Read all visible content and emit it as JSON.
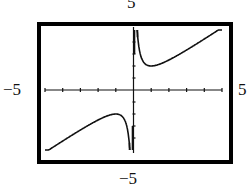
{
  "chart_data": {
    "type": "line",
    "title": "",
    "function": "y = x + 1/x",
    "xlabel": "",
    "ylabel": "",
    "xlim": [
      -5,
      5
    ],
    "ylim": [
      -5,
      5
    ],
    "window_labels": {
      "top": "5",
      "bottom": "−5",
      "left": "−5",
      "right": "5"
    },
    "x_ticks_step": 1,
    "y_ticks_step": 1,
    "grid": false,
    "legend": null,
    "series": [
      {
        "name": "left branch",
        "x": [
          -5,
          -4,
          -3,
          -2,
          -1.5,
          -1,
          -0.7,
          -0.5,
          -0.35,
          -0.25,
          -0.2
        ],
        "y": [
          -5.2,
          -4.25,
          -3.33,
          -2.5,
          -2.17,
          -2,
          -2.13,
          -2.5,
          -3.21,
          -4.25,
          -5
        ]
      },
      {
        "name": "right branch",
        "x": [
          0.2,
          0.25,
          0.35,
          0.5,
          0.7,
          1,
          1.5,
          2,
          3,
          4,
          5
        ],
        "y": [
          5,
          4.25,
          3.21,
          2.5,
          2.13,
          2,
          2.17,
          2.5,
          3.33,
          4.25,
          5.2
        ]
      }
    ],
    "colors": {
      "frame": "#000000",
      "curve": "#111111",
      "axes": "#111111",
      "background": "#ffffff"
    }
  }
}
